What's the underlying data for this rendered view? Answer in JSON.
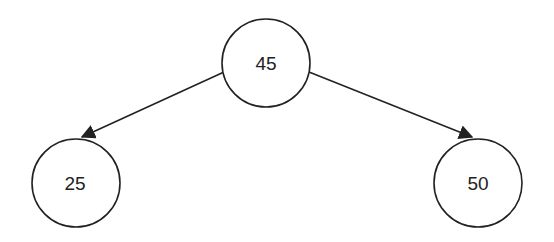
{
  "diagram": {
    "type": "binary-tree",
    "nodes": [
      {
        "id": "root",
        "label": "45"
      },
      {
        "id": "left",
        "label": "25"
      },
      {
        "id": "right",
        "label": "50"
      }
    ],
    "edges": [
      {
        "from": "45",
        "to": "25"
      },
      {
        "from": "45",
        "to": "50"
      }
    ],
    "colors": {
      "stroke": "#222222",
      "background": "#ffffff"
    }
  }
}
